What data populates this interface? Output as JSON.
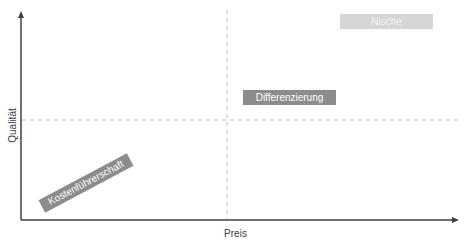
{
  "diagram": {
    "x_axis_label": "Preis",
    "y_axis_label": "Qualität",
    "quadrant_boxes": [
      {
        "label": "Nische",
        "color": "#d6d6d6"
      },
      {
        "label": "Differenzierung",
        "color": "#8c8c8c"
      },
      {
        "label": "Kostenführerschaft",
        "color": "#8c8c8c"
      }
    ],
    "colors": {
      "axis": "#404040",
      "divider": "#bfbfbf"
    }
  }
}
